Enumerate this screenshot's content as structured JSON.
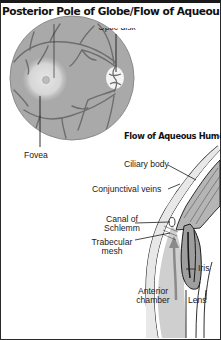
{
  "title": "Posterior Pole of Globe/Flow of Aqueous Humor",
  "fundus": {
    "labels": {
      "optic_disk": "Optic disk",
      "fovea": "Fovea"
    },
    "colors": {
      "retina": "#a9a9a9",
      "retina_edge": "#8e8e8e",
      "macula": "#d6d6d6",
      "vessels": "#6e6e6e",
      "optic_disk": "#f4f4f4"
    }
  },
  "aqueous": {
    "subtitle": "Flow of Aqueous Humor",
    "labels": {
      "ciliary_body": "Ciliary body",
      "conjunctival_veins": "Conjunctival veins",
      "canal_of_schlemm_line1": "Canal of",
      "canal_of_schlemm_line2": "Schlemm",
      "trabecular_mesh_line1": "Trabecular",
      "trabecular_mesh_line2": "mesh",
      "iris": "Iris",
      "anterior_chamber_line1": "Anterior",
      "anterior_chamber_line2": "chamber",
      "lens": "Lens"
    },
    "colors": {
      "chamber": "#cfcfcf",
      "tissue": "#b5b5b5",
      "outline": "#1a1a1a"
    }
  }
}
